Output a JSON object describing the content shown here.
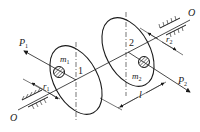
{
  "diagram": {
    "type": "rotor-balance-schematic",
    "axis": {
      "label_left": "O",
      "label_right": "O"
    },
    "discs": [
      {
        "id": "1",
        "mass_label": "m",
        "mass_sub": "1",
        "radius_label": "r",
        "radius_sub": "1",
        "force_label": "P",
        "force_sub": "1"
      },
      {
        "id": "2",
        "mass_label": "m",
        "mass_sub": "2",
        "radius_label": "r",
        "radius_sub": "2",
        "force_label": "P",
        "force_sub": "2"
      }
    ],
    "spacing_label": "l",
    "colors": {
      "stroke": "#1a1a1a",
      "background": "#ffffff"
    }
  }
}
